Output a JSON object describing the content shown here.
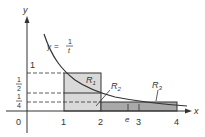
{
  "figure": {
    "curve_label": "y = 1/t",
    "curve_label_parts": {
      "lhs": "y",
      "eq": "=",
      "num": "1",
      "den": "t"
    },
    "axes": {
      "x_label": "x",
      "y_label": "y",
      "origin_label": "0"
    },
    "x_ticks": [
      {
        "label": "1",
        "value": 1
      },
      {
        "label": "2",
        "value": 2
      },
      {
        "label": "e",
        "value": 2.718
      },
      {
        "label": "3",
        "value": 3
      },
      {
        "label": "4",
        "value": 4
      }
    ],
    "y_ticks": [
      {
        "label": "1",
        "value": 1
      },
      {
        "label": "1/2",
        "num": "1",
        "den": "2",
        "value": 0.5
      },
      {
        "label": "1/4",
        "num": "1",
        "den": "4",
        "value": 0.25
      }
    ],
    "regions": [
      {
        "label": "R",
        "sub": "1",
        "desc": "rectangle from x=1 to x=2, height 1"
      },
      {
        "label": "R",
        "sub": "2",
        "desc": "region near x=2 between curve and 1/2 line"
      },
      {
        "label": "R",
        "sub": "3",
        "desc": "rectangle from x=2 to x=4, height 1/4"
      }
    ],
    "colors": {
      "line": "#333333",
      "light_fill": "#d9d9d9",
      "dark_fill": "#a9a9a9"
    }
  }
}
